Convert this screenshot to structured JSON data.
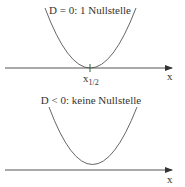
{
  "panels": [
    {
      "title": "D = 0: 1 Nullstelle",
      "axis_label": "x",
      "root_label": "x",
      "root_subscript": "1/2"
    },
    {
      "title": "D < 0: keine Nullstelle",
      "axis_label": "x"
    }
  ],
  "colors": {
    "axis": "#555555",
    "curve": "#666666",
    "tick": "#2a6a40",
    "text": "#333333"
  }
}
